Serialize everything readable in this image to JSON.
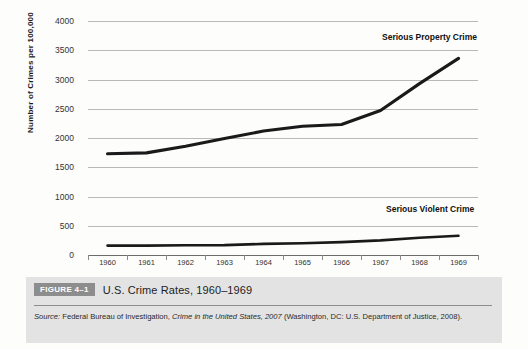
{
  "chart_data": {
    "type": "line",
    "xlabel": "",
    "ylabel": "Number of Crimes per 100,000",
    "categories": [
      "1960",
      "1961",
      "1962",
      "1963",
      "1964",
      "1965",
      "1966",
      "1967",
      "1968",
      "1969"
    ],
    "ylim": [
      0,
      4000
    ],
    "ytick_values": [
      0,
      500,
      1000,
      1500,
      2000,
      2500,
      3000,
      3500,
      4000
    ],
    "ytick_labels": [
      "0",
      "500",
      "1000",
      "1500",
      "2000",
      "2500",
      "3000",
      "3500",
      "4000"
    ],
    "grid": true,
    "legend_position": "inline-annotations",
    "series": [
      {
        "name": "Serious Property Crime",
        "values": [
          1730,
          1745,
          1860,
          1990,
          2120,
          2200,
          2230,
          2470,
          2930,
          3360
        ],
        "color": "#1a1a1a"
      },
      {
        "name": "Serious Violent Crime",
        "values": [
          160,
          160,
          165,
          170,
          190,
          200,
          220,
          250,
          295,
          330
        ],
        "color": "#1a1a1a"
      }
    ],
    "annotations": [
      {
        "text": "Serious Property Crime",
        "x": "1967",
        "y": 3700
      },
      {
        "text": "Serious Violent Crime",
        "x": "1967",
        "y": 620
      }
    ]
  },
  "caption": {
    "badge": "FIGURE 4–1",
    "title": "U.S. Crime Rates, 1960–1969",
    "source_prefix": "Source:",
    "source_part1": " Federal Bureau of Investigation, ",
    "source_italic": "Crime in the United States, 2007",
    "source_part2": " (Washington, DC: U.S. Department of Justice, 2008)."
  },
  "colors": {
    "line": "#1a1a1a",
    "grid": "#b9b9b9",
    "axis": "#6b6b6b",
    "caption_bg": "#e3e3e3",
    "badge_bg": "#8d8d8d",
    "page_bg": "#fdfdfc"
  }
}
